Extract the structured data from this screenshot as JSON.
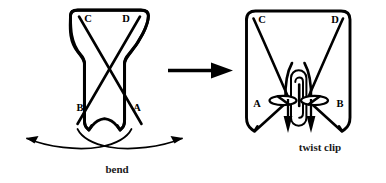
{
  "figure": {
    "background_color": "#ffffff",
    "ink_color": "#000000",
    "width": 386,
    "height": 183
  },
  "left_panel": {
    "name": "bow-shape-before",
    "labels": {
      "top_left": "C",
      "top_right": "D",
      "bottom_left": "B",
      "bottom_right": "A"
    },
    "caption": "bend",
    "description": "Hourglass-bow outline with two crossing diagonal strands"
  },
  "transition": {
    "name": "process-arrow",
    "direction": "right",
    "label": ""
  },
  "right_panel": {
    "name": "clipped-shape-after",
    "labels": {
      "top_left": "C",
      "top_right": "D",
      "bottom_left": "A",
      "bottom_right": "B"
    },
    "caption": "twist clip",
    "description": "Squared outline with paperclip at center and two downward arrows"
  }
}
